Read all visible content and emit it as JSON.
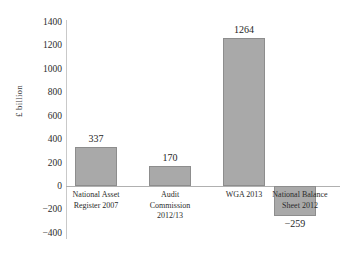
{
  "chart_data": {
    "type": "bar",
    "title": "",
    "xlabel": "",
    "ylabel": "£ billion",
    "categories": [
      "National Asset\nRegister 2007",
      "Audit\nCommission\n2012/13",
      "WGA 2013",
      "National Balance\nSheet 2012"
    ],
    "values": [
      337,
      170,
      1264,
      -259
    ],
    "value_labels": [
      "337",
      "170",
      "1264",
      "−259"
    ],
    "ylim": [
      -400,
      1400
    ],
    "yticks": [
      1400,
      1200,
      1000,
      800,
      600,
      400,
      200,
      0,
      -200,
      -400
    ],
    "ytick_labels": [
      "1400",
      "1200",
      "1000",
      "800",
      "600",
      "400",
      "200",
      "0",
      "−200",
      "−400"
    ],
    "grid": false,
    "legend": null,
    "bar_color": "#a9a9a9",
    "bar_edge_color": "#8d8d8d",
    "axis_color": "#b0b0b0",
    "background": "#ffffff"
  }
}
